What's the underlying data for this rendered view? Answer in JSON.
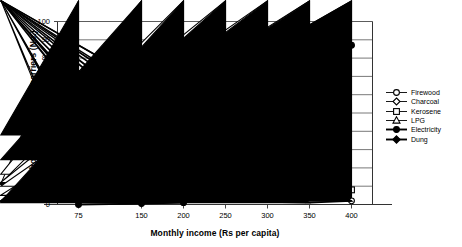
{
  "chart_data": {
    "type": "line",
    "title": "",
    "xlabel": "Monthly income (Rs per capita)",
    "ylabel": "Households using various carriers (No.)",
    "categories": [
      "75",
      "150",
      "200",
      "250",
      "300",
      "350",
      "400"
    ],
    "x": [
      75,
      150,
      200,
      250,
      300,
      350,
      400
    ],
    "xlim": [
      50,
      425
    ],
    "ylim": [
      0,
      100
    ],
    "yticks": [
      0,
      10,
      20,
      30,
      40,
      50,
      60,
      70,
      80,
      90,
      100
    ],
    "grid": "horizontal",
    "legend_position": "right",
    "series": [
      {
        "name": "Firewood",
        "marker": "open-circle",
        "color": "#000000",
        "values": [
          70,
          50,
          20.5,
          12,
          11,
          6,
          2
        ]
      },
      {
        "name": "Charcoal",
        "marker": "open-diamond",
        "color": "#000000",
        "values": [
          11,
          16.5,
          11.5,
          12,
          10,
          5,
          2
        ]
      },
      {
        "name": "Kerosene",
        "marker": "open-square",
        "color": "#000000",
        "values": [
          30,
          77,
          75.5,
          76,
          56,
          41,
          8
        ]
      },
      {
        "name": "LPG",
        "marker": "open-triangle",
        "color": "#000000",
        "values": [
          0,
          0.5,
          1,
          17,
          20,
          38,
          85
        ]
      },
      {
        "name": "Electricity",
        "marker": "filled-circle",
        "color": "#000000",
        "values": [
          0,
          0.5,
          1,
          12,
          30,
          48,
          87
        ]
      },
      {
        "name": "Dung",
        "marker": "filled-diamond",
        "color": "#000000",
        "values": [
          38,
          24.5,
          1.5,
          2,
          1.5,
          1,
          2
        ]
      }
    ]
  },
  "legend": {
    "items": [
      {
        "label": "Firewood"
      },
      {
        "label": "Charcoal"
      },
      {
        "label": "Kerosene"
      },
      {
        "label": "LPG"
      },
      {
        "label": "Electricity"
      },
      {
        "label": "Dung"
      }
    ]
  }
}
